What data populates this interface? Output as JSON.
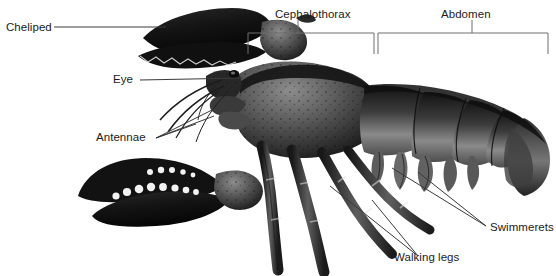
{
  "figure": {
    "background_color": "#ffffff",
    "label_color": "#1b1b1b",
    "leader_line_color": "#3a3a3a",
    "bracket_color": "#6e6e6e",
    "specimen_color_dark": "#1d1d1d",
    "specimen_color_mid": "#6a6a6a",
    "specimen_color_light": "#bdbdbd"
  },
  "labels": {
    "cheliped": "Cheliped",
    "eye": "Eye",
    "antennae": "Antennae",
    "cephalothorax": "Cephalothorax",
    "abdomen": "Abdomen",
    "swimmerets": "Swimmerets",
    "walking_legs": "Walking legs"
  }
}
